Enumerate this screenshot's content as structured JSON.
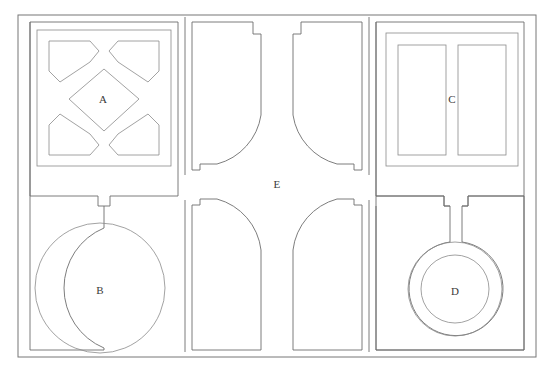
{
  "diagram": {
    "type": "floor-plan",
    "canvas": {
      "width": 554,
      "height": 376
    },
    "background_color": "#ffffff",
    "line_color": "#6e6e6e",
    "label_color": "#3a3a3a"
  },
  "outer_frame": {
    "x": 18,
    "y": 15,
    "width": 518,
    "height": 342
  },
  "rooms": [
    {
      "id": "A",
      "label": "A",
      "label_x": 103,
      "label_y": 99,
      "description": "upper-left hall with central diamond and four corner pentagons",
      "outer_rect": {
        "x": 37,
        "y": 30,
        "width": 134,
        "height": 136
      }
    },
    {
      "id": "B",
      "label": "B",
      "label_x": 100,
      "label_y": 290,
      "description": "lower-left rotunda with single large circle",
      "circle": {
        "cx": 100,
        "cy": 288,
        "r": 65
      }
    },
    {
      "id": "C",
      "label": "C",
      "label_x": 452,
      "label_y": 99,
      "description": "upper-right hall with two vertical bay rectangles",
      "outer_rect": {
        "x": 379,
        "y": 33,
        "width": 146,
        "height": 133
      }
    },
    {
      "id": "D",
      "label": "D",
      "label_x": 455,
      "label_y": 290,
      "description": "lower-right rotunda with two concentric circles",
      "outer_circle": {
        "cx": 455,
        "cy": 289,
        "r": 47
      },
      "inner_circle": {
        "cx": 455,
        "cy": 289,
        "r": 34
      }
    },
    {
      "id": "E",
      "label": "E",
      "label_x": 277,
      "label_y": 184,
      "description": "central courtyard formed by four concave quarter-circle corners"
    }
  ],
  "wings": [
    {
      "id": "upper-middle-left",
      "description": "notched vertical bay with concave curve at lower right"
    },
    {
      "id": "upper-middle-right",
      "description": "notched vertical bay with concave curve at lower left"
    },
    {
      "id": "lower-middle-left",
      "description": "notched vertical bay with concave curve at upper right"
    },
    {
      "id": "lower-middle-right",
      "description": "notched vertical bay with concave curve at upper left"
    }
  ]
}
